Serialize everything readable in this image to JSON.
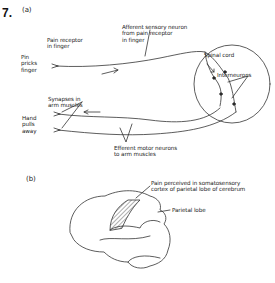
{
  "problem_number": "7.",
  "part_a": {
    "label": "(a)",
    "labels": {
      "pain_receptor": [
        "Pain receptor",
        "in finger"
      ],
      "pin_pricks": [
        "Pin",
        "pricks",
        "finger"
      ],
      "afferent": [
        "Afferent sensory neuron",
        "from pain receptor",
        "in finger"
      ],
      "spinal_cord": "Spinal cord",
      "interneurons": "Interneurons",
      "synapses": [
        "Synapses in",
        "arm muscles"
      ],
      "hand_pulls": [
        "Hand",
        "pulls",
        "away"
      ],
      "efferent": [
        "Efferent motor neurons",
        "to arm muscles"
      ]
    }
  },
  "part_b": {
    "label": "(b)",
    "labels": {
      "pain_perceived": [
        "Pain perceived in somatosensory",
        "cortex of parietal lobe of cerebrum"
      ],
      "parietal_lobe": "Parietal lobe"
    }
  }
}
